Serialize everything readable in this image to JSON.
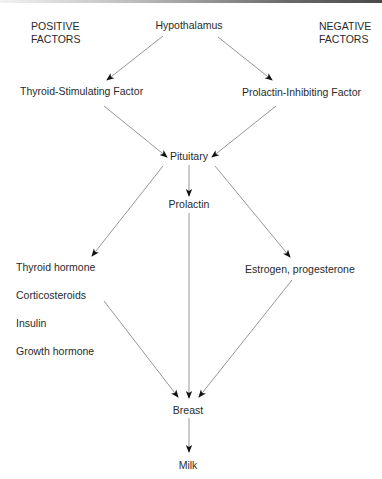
{
  "diagram": {
    "headers": {
      "positive": [
        "POSITIVE",
        "FACTORS"
      ],
      "negative": [
        "NEGATIVE",
        "FACTORS"
      ]
    },
    "nodes": {
      "hypothalamus": "Hypothalamus",
      "tsf": "Thyroid-Stimulating Factor",
      "pif": "Prolactin-Inhibiting Factor",
      "pituitary": "Pituitary",
      "prolactin": "Prolactin",
      "estrogen": "Estrogen, progesterone",
      "breast": "Breast",
      "milk": "Milk"
    },
    "positive_hormones": [
      "Thyroid hormone",
      "Corticosteroids",
      "Insulin",
      "Growth hormone"
    ],
    "edges": [
      {
        "from": "Hypothalamus",
        "to": "Thyroid-Stimulating Factor"
      },
      {
        "from": "Hypothalamus",
        "to": "Prolactin-Inhibiting Factor"
      },
      {
        "from": "Thyroid-Stimulating Factor",
        "to": "Pituitary"
      },
      {
        "from": "Prolactin-Inhibiting Factor",
        "to": "Pituitary"
      },
      {
        "from": "Pituitary",
        "to": "Prolactin"
      },
      {
        "from": "Pituitary",
        "to": "Thyroid hormone"
      },
      {
        "from": "Pituitary",
        "to": "Estrogen, progesterone"
      },
      {
        "from": "Positive hormones",
        "to": "Breast"
      },
      {
        "from": "Prolactin",
        "to": "Breast"
      },
      {
        "from": "Estrogen, progesterone",
        "to": "Breast"
      },
      {
        "from": "Breast",
        "to": "Milk"
      }
    ]
  }
}
